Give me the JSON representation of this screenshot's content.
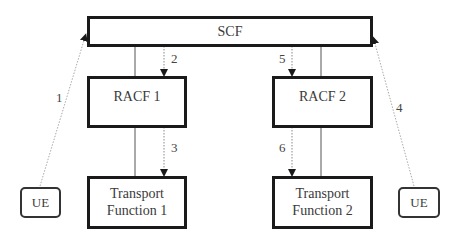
{
  "diagram": {
    "nodes": {
      "scf": {
        "label": "SCF"
      },
      "racf1": {
        "label": "RACF 1"
      },
      "racf2": {
        "label": "RACF 2"
      },
      "tf1": {
        "line1": "Transport",
        "line2": "Function 1"
      },
      "tf2": {
        "line1": "Transport",
        "line2": "Function 2"
      },
      "ue_left": {
        "label": "UE"
      },
      "ue_right": {
        "label": "UE"
      }
    },
    "steps": {
      "s1": "1",
      "s2": "2",
      "s3": "3",
      "s4": "4",
      "s5": "5",
      "s6": "6"
    },
    "edges": [
      {
        "from": "UE (left)",
        "to": "SCF",
        "step": "1",
        "style": "dotted-arrow"
      },
      {
        "from": "SCF",
        "to": "RACF 1",
        "step": "2",
        "style": "dotted-arrow"
      },
      {
        "from": "RACF 1",
        "to": "Transport Function 1",
        "step": "3",
        "style": "dotted-arrow"
      },
      {
        "from": "UE (right)",
        "to": "SCF",
        "step": "4",
        "style": "dotted-arrow"
      },
      {
        "from": "SCF",
        "to": "RACF 2",
        "step": "5",
        "style": "dotted-arrow"
      },
      {
        "from": "RACF 2",
        "to": "Transport Function 2",
        "step": "6",
        "style": "dotted-arrow"
      },
      {
        "from": "SCF",
        "to": "RACF 1",
        "style": "solid-line"
      },
      {
        "from": "RACF 1",
        "to": "Transport Function 1",
        "style": "solid-line"
      },
      {
        "from": "SCF",
        "to": "RACF 2",
        "style": "solid-line"
      },
      {
        "from": "RACF 2",
        "to": "Transport Function 2",
        "style": "solid-line"
      }
    ],
    "colors": {
      "box_border": "#1a1a1a",
      "solid_link": "#555555",
      "dotted_link": "#888888",
      "text": "#3a3a3a"
    }
  }
}
